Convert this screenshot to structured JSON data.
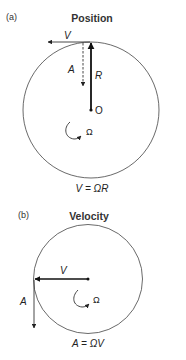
{
  "panel_a": {
    "tag": "(a)",
    "title": "Position",
    "velocity_label": "V",
    "acceleration_label": "A",
    "radius_label": "R",
    "origin_label": "O",
    "omega_label": "Ω",
    "equation": "V = ΩR"
  },
  "panel_b": {
    "tag": "(b)",
    "title": "Velocity",
    "velocity_label": "V",
    "acceleration_label": "A",
    "omega_label": "Ω",
    "equation": "A = ΩV"
  }
}
